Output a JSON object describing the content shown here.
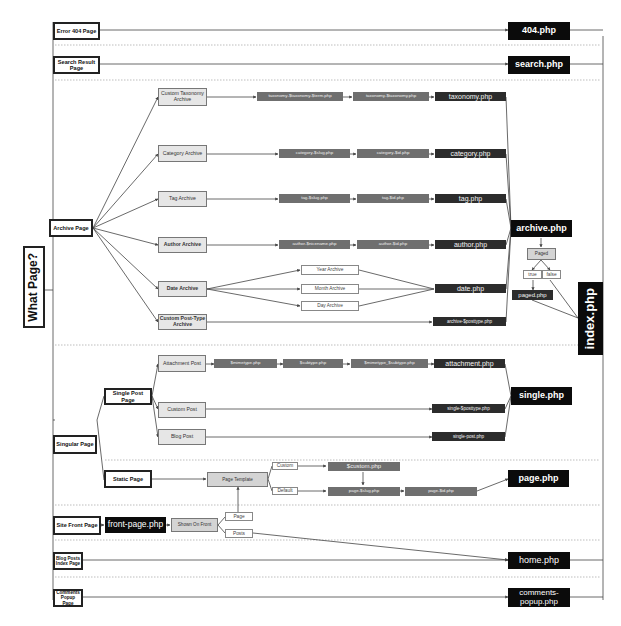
{
  "diagram": {
    "root": {
      "label": "What Page?"
    },
    "fallback": {
      "label": "index.php"
    },
    "page_types": {
      "error404": "Error 404 Page",
      "search": "Search Result Page",
      "archive": "Archive Page",
      "singular": "Singular Page",
      "single_post": "Single Post Page",
      "static_page": "Static Page",
      "site_front": "Site Front Page",
      "blog_posts_index": "Blog Posts Index Page",
      "comments_popup": "Comments Popup Page"
    },
    "archive_types": {
      "custom_taxonomy": "Custom Taxonomy Archive",
      "category": "Category Archive",
      "tag": "Tag Archive",
      "author": "Author Archive",
      "date": "Date Archive",
      "custom_post_type": "Custom Post-Type Archive"
    },
    "date_types": {
      "year": "Year Archive",
      "month": "Month Archive",
      "day": "Day Archive"
    },
    "single_types": {
      "attachment": "Attachment Post",
      "custom": "Custom Post",
      "blog": "Blog Post"
    },
    "templates": {
      "taxonomy_term": "taxonomy-$taxonomy-$term.php",
      "taxonomy_tax": "taxonomy-$taxonomy.php",
      "taxonomy": "taxonomy.php",
      "category_slug": "category-$slug.php",
      "category_id": "category-$id.php",
      "category": "category.php",
      "tag_slug": "tag-$slug.php",
      "tag_id": "tag-$id.php",
      "tag": "tag.php",
      "author_nicename": "author-$nicename.php",
      "author_id": "author-$id.php",
      "author": "author.php",
      "date": "date.php",
      "archive_posttype": "archive-$posttype.php",
      "archive": "archive.php",
      "paged": "paged.php",
      "mimetype": "$mimetype.php",
      "subtype": "$subtype.php",
      "mimetype_subtype": "$mimetype_$subtype.php",
      "attachment": "attachment.php",
      "single_posttype": "single-$posttype.php",
      "single_post": "single-post.php",
      "single": "single.php",
      "custom": "$custom.php",
      "page_slug": "page-$slug.php",
      "page_id": "page-$id.php",
      "page": "page.php",
      "front_page": "front-page.php",
      "home": "home.php",
      "error404": "404.php",
      "search": "search.php",
      "comments_popup": "comments-popup.php"
    },
    "conditions": {
      "paged": "Paged",
      "true": "true",
      "false": "false",
      "page_template": "Page Template",
      "custom": "Custom",
      "default": "Default",
      "shown_on_front": "Shown On Front",
      "page": "Page",
      "posts": "Posts"
    },
    "colors": {
      "final_template": "#0b0b0b",
      "specific_template": "#2c2c2c",
      "most_specific_template": "#6f6f6f",
      "sub_type_fill": "#e6e6e6",
      "line": "#444444",
      "separator": "#bbbbbb"
    }
  }
}
